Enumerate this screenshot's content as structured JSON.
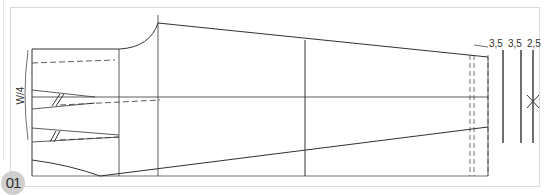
{
  "figure": {
    "number": "01",
    "labels": {
      "waist_quarter": "W/4",
      "measure_1": "3,5",
      "measure_2": "3,5",
      "measure_3": "2,5"
    },
    "colors": {
      "line": "#333333",
      "frame": "#d9d9d9",
      "badge": "#cfcfcf"
    }
  }
}
